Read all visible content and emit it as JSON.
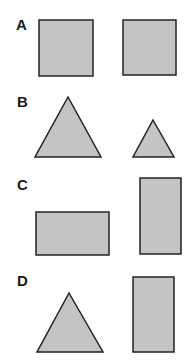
{
  "colors": {
    "fill": "#c4c4c4",
    "stroke": "#222222",
    "label": "#1a1a1a"
  },
  "rows": [
    {
      "label": "A",
      "shapes": [
        {
          "type": "square",
          "x": 39,
          "y": 20,
          "w": 54,
          "h": 56
        },
        {
          "type": "square",
          "x": 123,
          "y": 20,
          "w": 53,
          "h": 55
        }
      ]
    },
    {
      "label": "B",
      "shapes": [
        {
          "type": "triangle",
          "points": "68,97 101,157 35,157"
        },
        {
          "type": "triangle",
          "points": "153,120 174,157 133,157"
        }
      ]
    },
    {
      "label": "C",
      "shapes": [
        {
          "type": "rectangle",
          "x": 36,
          "y": 212,
          "w": 73,
          "h": 43
        },
        {
          "type": "rectangle",
          "x": 140,
          "y": 178,
          "w": 41,
          "h": 76
        }
      ]
    },
    {
      "label": "D",
      "shapes": [
        {
          "type": "triangle",
          "points": "69,293 103,352 37,352"
        },
        {
          "type": "rectangle",
          "x": 133,
          "y": 277,
          "w": 41,
          "h": 75
        }
      ]
    }
  ]
}
